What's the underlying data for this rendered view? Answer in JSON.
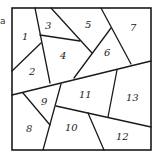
{
  "figure": {
    "type": "region-partition-diagram",
    "corner_mark": "a",
    "colors": {
      "line": "#1a1a1a",
      "label": "#222222",
      "background": "#ffffff"
    },
    "regions": [
      {
        "id": "1",
        "label": "1"
      },
      {
        "id": "2",
        "label": "2"
      },
      {
        "id": "3",
        "label": "3"
      },
      {
        "id": "4",
        "label": "4"
      },
      {
        "id": "5",
        "label": "5"
      },
      {
        "id": "6",
        "label": "6"
      },
      {
        "id": "7",
        "label": "7"
      },
      {
        "id": "8",
        "label": "8"
      },
      {
        "id": "9",
        "label": "9"
      },
      {
        "id": "10",
        "label": "10"
      },
      {
        "id": "11",
        "label": "11"
      },
      {
        "id": "12",
        "label": "12"
      },
      {
        "id": "13",
        "label": "13"
      }
    ]
  }
}
